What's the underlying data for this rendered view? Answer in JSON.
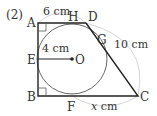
{
  "problem": {
    "number_label": "(2)"
  },
  "points": {
    "A": "A",
    "B": "B",
    "C": "C",
    "D": "D",
    "E": "E",
    "F": "F",
    "G": "G",
    "H": "H",
    "O": "O"
  },
  "dimensions": {
    "AD": "6 cm",
    "radius": "4 cm",
    "DC": "10 cm",
    "FC_prefix": "x",
    "FC_suffix": " cm"
  },
  "colors": {
    "line": "#222222",
    "circle": "#666666",
    "dim_arc": "#d0d0d0",
    "text": "#333333"
  }
}
